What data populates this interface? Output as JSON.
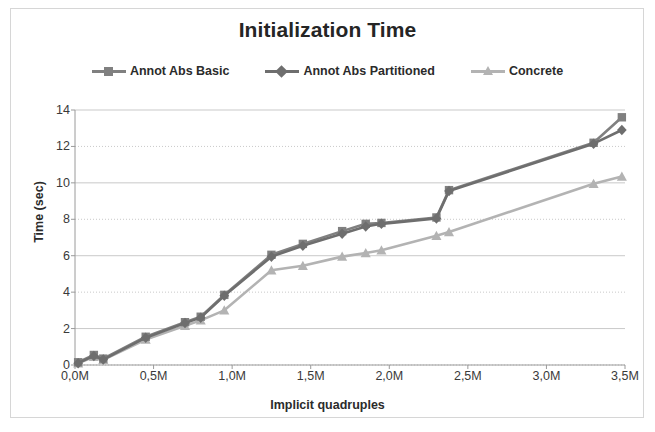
{
  "chart_data": {
    "type": "line",
    "title": "Initialization Time",
    "xlabel": "Implicit quadruples",
    "ylabel": "Time (sec)",
    "xlim": [
      0,
      3.5
    ],
    "ylim": [
      0,
      14
    ],
    "xtick_labels": [
      "0,0M",
      "0,5M",
      "1,0M",
      "1,5M",
      "2,0M",
      "2,5M",
      "3,0M",
      "3,5M"
    ],
    "xtick_values": [
      0,
      0.5,
      1.0,
      1.5,
      2.0,
      2.5,
      3.0,
      3.5
    ],
    "ytick_labels": [
      "0",
      "2",
      "4",
      "6",
      "8",
      "10",
      "12",
      "14"
    ],
    "ytick_values": [
      0,
      2,
      4,
      6,
      8,
      10,
      12,
      14
    ],
    "grid": "horizontal",
    "legend_position": "top",
    "series": [
      {
        "name": "Annot Abs Basic",
        "marker": "square",
        "color": "#808080",
        "x": [
          0.02,
          0.12,
          0.18,
          0.45,
          0.7,
          0.8,
          0.95,
          1.25,
          1.45,
          1.7,
          1.85,
          1.95,
          2.3,
          2.38,
          3.3,
          3.48
        ],
        "y": [
          0.15,
          0.55,
          0.35,
          1.55,
          2.35,
          2.65,
          3.85,
          6.05,
          6.65,
          7.35,
          7.75,
          7.8,
          8.1,
          9.6,
          12.2,
          13.6
        ]
      },
      {
        "name": "Annot Abs Partitioned",
        "marker": "diamond",
        "color": "#6e6e6e",
        "x": [
          0.02,
          0.12,
          0.18,
          0.45,
          0.7,
          0.8,
          0.95,
          1.25,
          1.45,
          1.7,
          1.85,
          1.95,
          2.3,
          2.38,
          3.3,
          3.48
        ],
        "y": [
          0.1,
          0.5,
          0.3,
          1.5,
          2.3,
          2.6,
          3.8,
          5.95,
          6.55,
          7.2,
          7.6,
          7.75,
          8.05,
          9.55,
          12.15,
          12.9
        ]
      },
      {
        "name": "Concrete",
        "marker": "triangle",
        "color": "#b3b3b3",
        "x": [
          0.02,
          0.12,
          0.18,
          0.45,
          0.7,
          0.8,
          0.95,
          1.25,
          1.45,
          1.7,
          1.85,
          1.95,
          2.3,
          2.38,
          3.3,
          3.48
        ],
        "y": [
          0.1,
          0.45,
          0.28,
          1.4,
          2.15,
          2.45,
          3.0,
          5.2,
          5.45,
          5.95,
          6.15,
          6.3,
          7.1,
          7.3,
          9.95,
          10.35
        ]
      }
    ]
  }
}
